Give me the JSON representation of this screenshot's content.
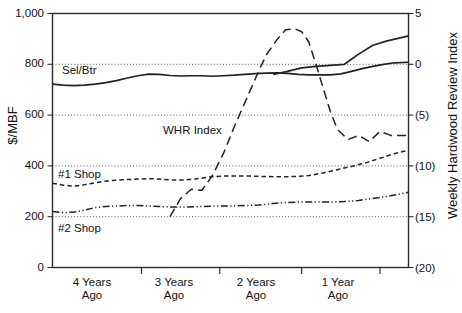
{
  "chart_data": {
    "type": "line",
    "title": "",
    "xlabel": "",
    "ylabel": "$/MBF",
    "y2label": "Weekly Hardwood Review Index",
    "grid": true,
    "legend_position": "inline-labels",
    "ylim": [
      0,
      1000
    ],
    "y2lim": [
      -20,
      5
    ],
    "yticks": [
      0,
      200,
      400,
      600,
      800,
      1000
    ],
    "ytick_labels": [
      "0",
      "200",
      "400",
      "600",
      "800",
      "1,000"
    ],
    "y2ticks": [
      5,
      0,
      -5,
      -10,
      -15,
      -20
    ],
    "y2tick_labels": [
      "5",
      "0",
      "(5)",
      "(10)",
      "(15)",
      "(20)"
    ],
    "xticks": [
      0.25,
      0.47,
      0.7,
      0.92
    ],
    "xtick_labels": [
      "4 Years\nAgo",
      "3 Years\nAgo",
      "2 Years\nAgo",
      "1 Year\nAgo"
    ],
    "xtick_lines": [
      [
        "4 Years",
        "Ago"
      ],
      [
        "3 Years",
        "Ago"
      ],
      [
        "2 Years",
        "Ago"
      ],
      [
        "1 Year",
        "Ago"
      ]
    ],
    "series": [
      {
        "name": "Sel/Btr",
        "axis": "left",
        "style": "solid",
        "label_x": 0.07,
        "label_y": 775,
        "x": [
          0.0,
          0.03,
          0.06,
          0.09,
          0.12,
          0.15,
          0.18,
          0.21,
          0.24,
          0.27,
          0.3,
          0.33,
          0.36,
          0.39,
          0.42,
          0.45,
          0.48,
          0.51,
          0.54,
          0.57,
          0.6,
          0.63,
          0.66,
          0.69,
          0.72,
          0.75,
          0.78,
          0.81,
          0.84,
          0.87,
          0.9,
          0.93,
          0.96,
          1.0
        ],
        "values": [
          722,
          718,
          716,
          718,
          722,
          728,
          736,
          746,
          755,
          761,
          760,
          756,
          754,
          755,
          755,
          753,
          755,
          757,
          760,
          763,
          765,
          766,
          764,
          760,
          758,
          758,
          758,
          762,
          772,
          783,
          792,
          800,
          806,
          808
        ]
      },
      {
        "name": "Sel/Btr-late",
        "axis": "left",
        "style": "solid-continued",
        "x": [
          0.62,
          0.66,
          0.7,
          0.74,
          0.78,
          0.82,
          0.86,
          0.9,
          0.94,
          0.98,
          1.0
        ],
        "values": [
          760,
          772,
          786,
          792,
          796,
          800,
          840,
          875,
          892,
          905,
          912
        ]
      },
      {
        "name": "WHR Index",
        "axis": "right",
        "style": "dashed-long",
        "label_x": 0.31,
        "label_y_left": 520,
        "x": [
          0.33,
          0.36,
          0.39,
          0.42,
          0.45,
          0.48,
          0.51,
          0.545,
          0.575,
          0.6,
          0.63,
          0.655,
          0.68,
          0.7,
          0.72,
          0.74,
          0.76,
          0.78,
          0.8,
          0.83,
          0.86,
          0.89,
          0.92,
          0.95,
          0.98,
          1.0
        ],
        "values": [
          -15.0,
          -13.2,
          -12.3,
          -12.4,
          -10.9,
          -8.8,
          -6.2,
          -3.4,
          -1.0,
          0.9,
          2.4,
          3.4,
          3.5,
          3.2,
          2.2,
          0.0,
          -2.3,
          -4.6,
          -6.4,
          -7.4,
          -7.0,
          -7.6,
          -6.6,
          -7.0,
          -7.0,
          -7.0
        ]
      },
      {
        "name": "#1 Shop",
        "axis": "left",
        "style": "dashed-short",
        "label_x": 0.06,
        "label_y": 372,
        "x": [
          0.0,
          0.03,
          0.06,
          0.09,
          0.12,
          0.15,
          0.18,
          0.21,
          0.24,
          0.27,
          0.3,
          0.33,
          0.36,
          0.4,
          0.44,
          0.48,
          0.52,
          0.56,
          0.6,
          0.64,
          0.68,
          0.72,
          0.76,
          0.8,
          0.84,
          0.88,
          0.92,
          0.96,
          1.0
        ],
        "values": [
          332,
          324,
          320,
          326,
          334,
          340,
          344,
          346,
          348,
          350,
          348,
          345,
          344,
          348,
          356,
          360,
          360,
          360,
          358,
          357,
          358,
          362,
          372,
          385,
          398,
          412,
          430,
          448,
          462
        ]
      },
      {
        "name": "#2 Shop",
        "axis": "left",
        "style": "dash-dot-dot",
        "label_x": 0.06,
        "label_y": 178,
        "x": [
          0.0,
          0.03,
          0.06,
          0.09,
          0.12,
          0.15,
          0.18,
          0.21,
          0.24,
          0.27,
          0.3,
          0.34,
          0.38,
          0.42,
          0.46,
          0.5,
          0.54,
          0.58,
          0.62,
          0.66,
          0.7,
          0.74,
          0.78,
          0.82,
          0.86,
          0.9,
          0.94,
          0.97,
          1.0
        ],
        "values": [
          220,
          216,
          218,
          226,
          236,
          240,
          242,
          244,
          244,
          242,
          240,
          238,
          238,
          240,
          242,
          242,
          244,
          246,
          252,
          256,
          258,
          258,
          258,
          260,
          264,
          272,
          280,
          288,
          296
        ]
      }
    ]
  },
  "series_labels": {
    "sel_btr": "Sel/Btr",
    "whr_index": "WHR Index",
    "shop1": "#1 Shop",
    "shop2": "#2 Shop"
  },
  "axes": {
    "left_title": "$/MBF",
    "right_title": "Weekly Hardwood Review Index"
  }
}
